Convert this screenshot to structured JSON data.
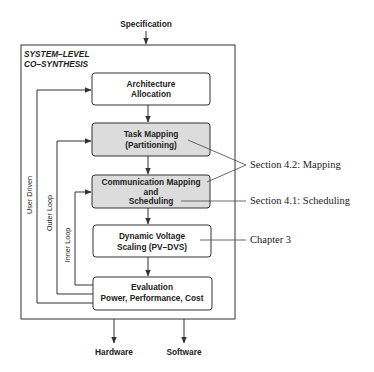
{
  "diagram": {
    "input": "Specification",
    "group": {
      "line1": "SYSTEM–LEVEL",
      "line2": "CO–SYNTHESIS"
    },
    "steps": [
      {
        "id": "arch",
        "lines": [
          "Architecture",
          "Allocation"
        ],
        "shaded": false
      },
      {
        "id": "task",
        "lines": [
          "Task Mapping",
          "(Partitioning)"
        ],
        "shaded": true
      },
      {
        "id": "comm",
        "lines": [
          "Communication Mapping",
          "and",
          "Scheduling"
        ],
        "shaded": true
      },
      {
        "id": "dvs",
        "lines": [
          "Dynamic Voltage",
          "Scaling (PV–DVS)"
        ],
        "shaded": false
      },
      {
        "id": "eval",
        "lines": [
          "Evaluation",
          "Power, Performance, Cost"
        ],
        "shaded": false
      }
    ],
    "loops": {
      "user_driven": "User Driven",
      "outer": "Outer Loop",
      "inner": "Inner Loop"
    },
    "outputs": {
      "hardware": "Hardware",
      "software": "Software"
    },
    "annotations": {
      "mapping": "Section 4.2: Mapping",
      "scheduling": "Section 4.1: Scheduling",
      "chapter": "Chapter 3"
    },
    "colors": {
      "shaded_fill": "#dcdcdc",
      "plain_fill": "#ffffff",
      "stroke": "#333333"
    }
  }
}
